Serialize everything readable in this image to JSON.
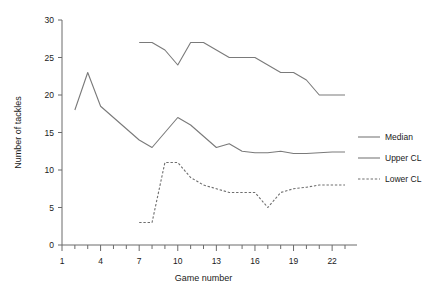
{
  "chart_data": {
    "type": "line",
    "title": "",
    "xlabel": "Game number",
    "ylabel": "Number of tackles",
    "xlim": [
      1,
      23
    ],
    "ylim": [
      0,
      30
    ],
    "xticks": [
      1,
      4,
      7,
      10,
      13,
      16,
      19,
      22
    ],
    "xticklabels": [
      "1",
      "4",
      "7",
      "10",
      "13",
      "16",
      "19",
      "22"
    ],
    "yticks": [
      0,
      5,
      10,
      15,
      20,
      25,
      30
    ],
    "yticklabels": [
      "0",
      "5",
      "10",
      "15",
      "20",
      "25",
      "30"
    ],
    "xtick_minor_step": 1,
    "grid": false,
    "legend_position": "right",
    "series": [
      {
        "name": "Median",
        "style": "solid",
        "color": "#7a7a7a",
        "x": [
          2,
          3,
          4,
          5,
          6,
          7,
          8,
          9,
          10,
          11,
          12,
          13,
          14,
          15,
          16,
          17,
          18,
          19,
          20,
          21,
          22,
          23
        ],
        "values": [
          18,
          23,
          18.5,
          17,
          15.5,
          14,
          13,
          15,
          17,
          16,
          14.5,
          13,
          13.5,
          12.5,
          12.3,
          12.3,
          12.5,
          12.2,
          12.2,
          12.3,
          12.4,
          12.4
        ]
      },
      {
        "name": "Upper CL",
        "style": "solid",
        "color": "#7a7a7a",
        "x": [
          7,
          8,
          9,
          10,
          11,
          12,
          13,
          14,
          15,
          16,
          17,
          18,
          19,
          20,
          21,
          22,
          23
        ],
        "values": [
          27,
          27,
          26,
          24,
          27,
          27,
          26,
          25,
          25,
          25,
          24,
          23,
          23,
          22,
          20,
          20,
          20
        ]
      },
      {
        "name": "Lower CL",
        "style": "dashed",
        "color": "#6e6e6e",
        "x": [
          7,
          8,
          9,
          10,
          11,
          12,
          13,
          14,
          15,
          16,
          17,
          18,
          19,
          20,
          21,
          22,
          23
        ],
        "values": [
          3,
          3,
          11,
          11,
          9,
          8,
          7.5,
          7,
          7,
          7,
          5,
          7,
          7.5,
          7.7,
          8,
          8,
          8
        ]
      }
    ]
  },
  "legend": {
    "items": [
      {
        "label": "Median",
        "style": "solid"
      },
      {
        "label": "Upper CL",
        "style": "solid"
      },
      {
        "label": "Lower CL",
        "style": "dashed"
      }
    ]
  }
}
